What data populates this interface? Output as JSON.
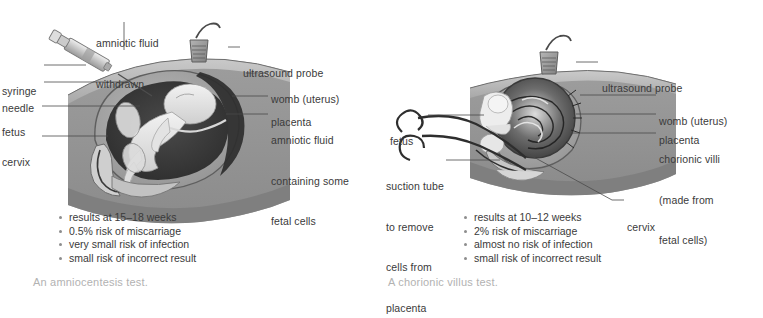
{
  "figure": {
    "background": "#ffffff",
    "label_color": "#3a3a3a",
    "caption_color": "#b2b2b2",
    "bullet_color": "#8d8d8d"
  },
  "panels": [
    {
      "id": "amniocentesis",
      "caption": "An amniocentesis test.",
      "labels": [
        {
          "name": "amniotic-fluid-withdrawn",
          "lines": [
            "amniotic fluid",
            "withdrawn"
          ]
        },
        {
          "name": "syringe",
          "lines": [
            "syringe"
          ]
        },
        {
          "name": "needle",
          "lines": [
            "needle"
          ]
        },
        {
          "name": "fetus",
          "lines": [
            "fetus"
          ]
        },
        {
          "name": "cervix",
          "lines": [
            "cervix"
          ]
        },
        {
          "name": "ultrasound-probe",
          "lines": [
            "ultrasound probe"
          ]
        },
        {
          "name": "womb-uterus",
          "lines": [
            "womb (uterus)"
          ]
        },
        {
          "name": "placenta",
          "lines": [
            "placenta"
          ]
        },
        {
          "name": "amniotic-fluid-fetal-cells",
          "lines": [
            "amniotic fluid",
            "containing some",
            "fetal cells"
          ]
        }
      ],
      "bullets": [
        "results at 15–18 weeks",
        "0.5% risk of miscarriage",
        "very small risk of infection",
        "small risk of incorrect result"
      ]
    },
    {
      "id": "chorionic-villus",
      "caption": "A chorionic villus test.",
      "labels": [
        {
          "name": "ultrasound-probe",
          "lines": [
            "ultrasound probe"
          ]
        },
        {
          "name": "fetus",
          "lines": [
            "fetus"
          ]
        },
        {
          "name": "suction-tube",
          "lines": [
            "suction tube",
            "to remove",
            "cells from",
            "placenta"
          ]
        },
        {
          "name": "womb-uterus",
          "lines": [
            "womb (uterus)"
          ]
        },
        {
          "name": "placenta",
          "lines": [
            "placenta"
          ]
        },
        {
          "name": "chorionic-villi",
          "lines": [
            "chorionic villi",
            "(made from",
            "fetal cells)"
          ]
        },
        {
          "name": "cervix",
          "lines": [
            "cervix"
          ]
        }
      ],
      "bullets": [
        "results at 10–12 weeks",
        "2% risk of miscarriage",
        "almost no risk of infection",
        "small risk of incorrect result"
      ]
    }
  ]
}
